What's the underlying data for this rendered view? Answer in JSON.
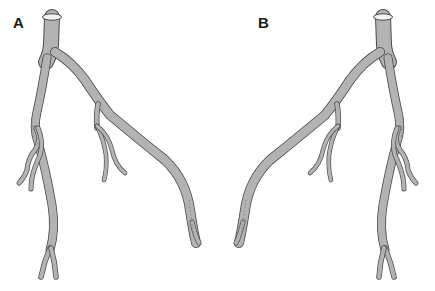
{
  "figure": {
    "panels": [
      {
        "id": "A",
        "label": "A",
        "description": "Coronary artery tree (left-origin orientation)"
      },
      {
        "id": "B",
        "label": "B",
        "description": "Coronary artery tree (mirrored orientation)"
      }
    ],
    "colors": {
      "vessel_fill": "#b3b3b3",
      "vessel_outline": "#4a4a4a",
      "background": "#ffffff",
      "ostium_inner": "#f2f2f2"
    }
  }
}
